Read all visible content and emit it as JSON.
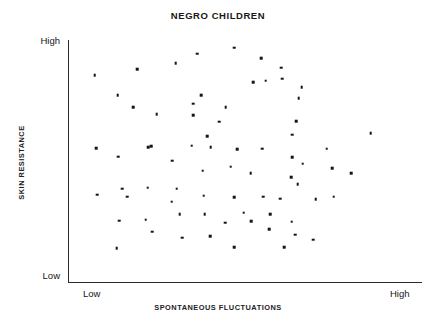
{
  "chart_data": {
    "type": "scatter",
    "title": "NEGRO CHILDREN",
    "xlabel": "SPONTANEOUS FLUCTUATIONS",
    "ylabel": "SKIN RESISTANCE",
    "x_tick_labels": [
      "Low",
      "High"
    ],
    "y_tick_labels": [
      "Low",
      "High"
    ],
    "xlim": [
      0,
      100
    ],
    "ylim": [
      0,
      100
    ],
    "grid": false,
    "legend": null,
    "point_color": "#141414",
    "axis_color": "#2b2b2b",
    "background_color": "#ffffff",
    "n_points": 73,
    "note": "Qualitative axes: both axes labeled only Low (origin) to High (far end). Values below are percent-of-axis positions read off the plot box.",
    "points": [
      {
        "x": 7.6,
        "y": 85.5
      },
      {
        "x": 14.0,
        "y": 77.3
      },
      {
        "x": 18.4,
        "y": 72.3
      },
      {
        "x": 19.5,
        "y": 87.9
      },
      {
        "x": 25.1,
        "y": 69.4
      },
      {
        "x": 30.4,
        "y": 90.5
      },
      {
        "x": 35.3,
        "y": 73.6
      },
      {
        "x": 36.5,
        "y": 94.3
      },
      {
        "x": 46.9,
        "y": 96.8
      },
      {
        "x": 54.5,
        "y": 92.6
      },
      {
        "x": 60.2,
        "y": 88.6
      },
      {
        "x": 66.0,
        "y": 80.4
      },
      {
        "x": 60.5,
        "y": 84.0
      },
      {
        "x": 65.2,
        "y": 75.9
      },
      {
        "x": 64.4,
        "y": 66.4
      },
      {
        "x": 63.4,
        "y": 60.9
      },
      {
        "x": 55.8,
        "y": 83.1
      },
      {
        "x": 52.3,
        "y": 82.6
      },
      {
        "x": 44.6,
        "y": 72.3
      },
      {
        "x": 37.6,
        "y": 77.1
      },
      {
        "x": 35.3,
        "y": 68.9
      },
      {
        "x": 42.7,
        "y": 66.3
      },
      {
        "x": 39.3,
        "y": 60.2
      },
      {
        "x": 7.9,
        "y": 55.4
      },
      {
        "x": 14.2,
        "y": 51.8
      },
      {
        "x": 23.5,
        "y": 56.0
      },
      {
        "x": 29.4,
        "y": 50.2
      },
      {
        "x": 22.6,
        "y": 55.7
      },
      {
        "x": 34.9,
        "y": 56.3
      },
      {
        "x": 40.3,
        "y": 55.6
      },
      {
        "x": 47.8,
        "y": 54.9
      },
      {
        "x": 54.8,
        "y": 55.0
      },
      {
        "x": 63.3,
        "y": 51.5
      },
      {
        "x": 66.3,
        "y": 48.8
      },
      {
        "x": 74.6,
        "y": 47.1
      },
      {
        "x": 73.1,
        "y": 55.1
      },
      {
        "x": 63.0,
        "y": 43.3
      },
      {
        "x": 51.6,
        "y": 45.0
      },
      {
        "x": 46.0,
        "y": 47.7
      },
      {
        "x": 38.1,
        "y": 46.0
      },
      {
        "x": 30.7,
        "y": 38.5
      },
      {
        "x": 22.5,
        "y": 39.0
      },
      {
        "x": 15.3,
        "y": 38.6
      },
      {
        "x": 8.3,
        "y": 36.0
      },
      {
        "x": 16.8,
        "y": 35.3
      },
      {
        "x": 29.3,
        "y": 33.2
      },
      {
        "x": 38.3,
        "y": 35.7
      },
      {
        "x": 46.9,
        "y": 35.1
      },
      {
        "x": 55.1,
        "y": 35.2
      },
      {
        "x": 60.0,
        "y": 34.5
      },
      {
        "x": 70.0,
        "y": 34.1
      },
      {
        "x": 75.0,
        "y": 35.2
      },
      {
        "x": 64.9,
        "y": 40.4
      },
      {
        "x": 57.2,
        "y": 28.0
      },
      {
        "x": 49.6,
        "y": 28.6
      },
      {
        "x": 38.6,
        "y": 27.9
      },
      {
        "x": 31.6,
        "y": 27.9
      },
      {
        "x": 22.0,
        "y": 25.8
      },
      {
        "x": 14.4,
        "y": 25.3
      },
      {
        "x": 44.4,
        "y": 24.5
      },
      {
        "x": 51.7,
        "y": 25.2
      },
      {
        "x": 63.2,
        "y": 25.0
      },
      {
        "x": 64.2,
        "y": 19.5
      },
      {
        "x": 69.3,
        "y": 17.5
      },
      {
        "x": 56.8,
        "y": 21.7
      },
      {
        "x": 40.2,
        "y": 19.0
      },
      {
        "x": 32.3,
        "y": 18.3
      },
      {
        "x": 23.8,
        "y": 20.7
      },
      {
        "x": 13.8,
        "y": 14.0
      },
      {
        "x": 47.0,
        "y": 14.5
      },
      {
        "x": 61.0,
        "y": 14.5
      },
      {
        "x": 80.0,
        "y": 45.0
      },
      {
        "x": 85.5,
        "y": 61.6
      }
    ]
  }
}
